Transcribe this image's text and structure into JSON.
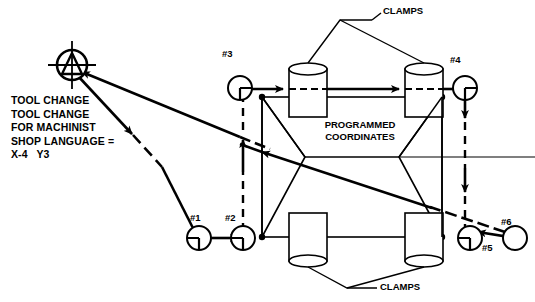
{
  "diagram": {
    "title_block": {
      "lines": [
        "TOOL CHANGE",
        "TOOL CHANGE",
        "FOR MACHINIST",
        "SHOP LANGUAGE =",
        "X-4   Y3"
      ],
      "text": "TOOL CHANGE\nTOOL CHANGE\nFOR MACHINIST\nSHOP LANGUAGE =\nX-4   Y3"
    },
    "labels": {
      "clamps_top": "CLAMPS",
      "clamps_bottom": "CLAMPS",
      "programmed_coordinates": "PROGRAMMED\nCOORDINATES"
    },
    "points": [
      {
        "id": "p1",
        "label": "#1",
        "x": 199,
        "y": 238
      },
      {
        "id": "p2",
        "label": "#2",
        "x": 243,
        "y": 238
      },
      {
        "id": "p3",
        "label": "#3",
        "x": 240,
        "y": 88
      },
      {
        "id": "p4",
        "label": "#4",
        "x": 465,
        "y": 88
      },
      {
        "id": "p5",
        "label": "#5",
        "x": 470,
        "y": 238
      },
      {
        "id": "p6",
        "label": "#6",
        "x": 515,
        "y": 238
      }
    ],
    "tool_change_origin": {
      "symbol": "tool-change-target",
      "x": 72,
      "y": 65
    },
    "colors": {
      "line": "#000000",
      "background": "#ffffff"
    }
  }
}
